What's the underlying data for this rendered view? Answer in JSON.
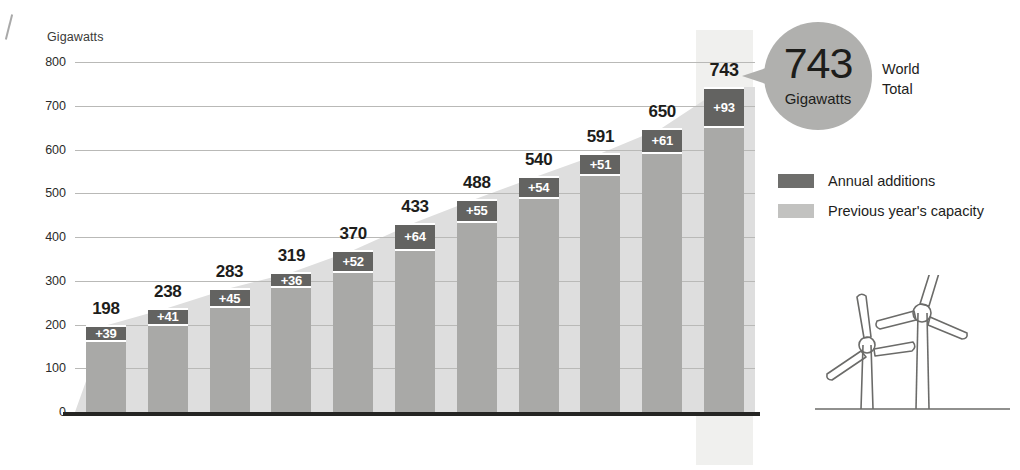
{
  "chart_data": {
    "type": "bar",
    "title": "",
    "xlabel": "",
    "ylabel": "Gigawatts",
    "ylim": [
      0,
      800
    ],
    "yticks": [
      800,
      700,
      600,
      500,
      400,
      300,
      200,
      100,
      0
    ],
    "grid": true,
    "legend_position": "right",
    "categories": [
      "2010",
      "2011",
      "2012",
      "2013",
      "2014",
      "2015",
      "2016",
      "2017",
      "2018",
      "2019",
      "2020"
    ],
    "series": [
      {
        "name": "Previous year's capacity",
        "values": [
          159,
          197,
          238,
          283,
          318,
          369,
          433,
          486,
          540,
          589,
          650
        ]
      },
      {
        "name": "Annual additions",
        "values": [
          39,
          41,
          45,
          36,
          52,
          64,
          55,
          54,
          51,
          61,
          93
        ]
      }
    ],
    "totals": [
      198,
      238,
      283,
      319,
      370,
      433,
      488,
      540,
      591,
      650,
      743
    ],
    "total_labels": [
      "198",
      "238",
      "283",
      "319",
      "370",
      "433",
      "488",
      "540",
      "591",
      "650",
      "743"
    ],
    "addition_labels": [
      "+39",
      "+41",
      "+45",
      "+36",
      "+52",
      "+64",
      "+55",
      "+54",
      "+51",
      "+61",
      "+93"
    ],
    "highlight_category": "2020",
    "colors": {
      "annual_additions": "#636361",
      "previous_capacity": "#a9a9a7",
      "ramp": "#dedede",
      "gridline": "#b9b9b7",
      "baseline": "#252523",
      "callout": "#b0b0ae",
      "highlight_band": "#f0f0ee"
    }
  },
  "axis": {
    "y_title": "Gigawatts"
  },
  "callout": {
    "value": "743",
    "unit": "Gigawatts",
    "side_line1": "World",
    "side_line2": "Total"
  },
  "legend": {
    "items": [
      {
        "label": "Annual additions",
        "color": "#6e6e6c"
      },
      {
        "label": "Previous year's capacity",
        "color": "#c2c2c0"
      }
    ]
  },
  "illustration": {
    "name": "wind-turbines"
  }
}
